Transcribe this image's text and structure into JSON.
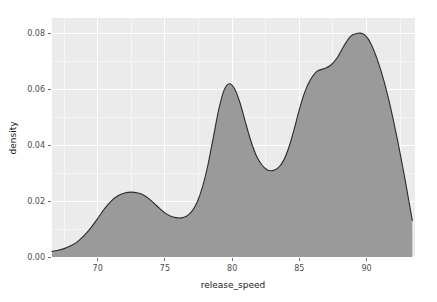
{
  "chart_data": {
    "type": "area",
    "title": "",
    "subtitle": "",
    "xlabel": "release_speed",
    "ylabel": "density",
    "xlim": [
      66.6,
      93.6
    ],
    "ylim": [
      0.0,
      0.0855
    ],
    "xticks": [
      70,
      75,
      80,
      85,
      90
    ],
    "xtick_labels": [
      "70",
      "75",
      "80",
      "85",
      "90"
    ],
    "yticks": [
      0.0,
      0.02,
      0.04,
      0.06,
      0.08
    ],
    "ytick_labels": [
      "0.00",
      "0.02",
      "0.04",
      "0.06",
      "0.08"
    ],
    "grid": true,
    "grid_minor": true,
    "legend": "none",
    "fill_color": "#9a9a9a",
    "line_color": "#2b2b2b",
    "panel_color": "#ebebeb",
    "grid_color": "#ffffff",
    "series": [
      {
        "name": "density",
        "x": [
          66.6,
          67.0,
          67.5,
          68.0,
          68.5,
          69.0,
          69.5,
          70.0,
          70.5,
          71.0,
          71.5,
          72.0,
          72.5,
          73.0,
          73.4,
          73.8,
          74.2,
          74.6,
          75.0,
          75.4,
          75.8,
          76.2,
          76.6,
          77.0,
          77.4,
          77.8,
          78.2,
          78.6,
          79.0,
          79.4,
          79.8,
          80.2,
          80.6,
          81.0,
          81.4,
          81.8,
          82.2,
          82.6,
          83.0,
          83.4,
          83.8,
          84.2,
          84.6,
          85.0,
          85.4,
          85.8,
          86.3,
          86.8,
          87.3,
          87.8,
          88.3,
          88.8,
          89.2,
          89.55,
          89.9,
          90.3,
          90.8,
          91.3,
          91.8,
          92.3,
          92.8,
          93.2,
          93.4
        ],
        "y": [
          0.002,
          0.0023,
          0.003,
          0.004,
          0.0055,
          0.0077,
          0.0105,
          0.0138,
          0.0172,
          0.02,
          0.0219,
          0.0229,
          0.0232,
          0.0229,
          0.0222,
          0.0209,
          0.0192,
          0.0174,
          0.0158,
          0.0147,
          0.0141,
          0.014,
          0.0146,
          0.0163,
          0.0197,
          0.0252,
          0.033,
          0.0428,
          0.0527,
          0.0597,
          0.062,
          0.06,
          0.0549,
          0.048,
          0.0414,
          0.0362,
          0.033,
          0.0312,
          0.0309,
          0.0318,
          0.0343,
          0.039,
          0.0455,
          0.0528,
          0.059,
          0.0632,
          0.0664,
          0.0673,
          0.0685,
          0.0712,
          0.0754,
          0.0789,
          0.0799,
          0.0801,
          0.0793,
          0.0765,
          0.0706,
          0.0628,
          0.0531,
          0.0418,
          0.0293,
          0.0185,
          0.0131
        ]
      }
    ],
    "features": {
      "peak_1": {
        "x": 72.5,
        "y": 0.0232
      },
      "valley_1": {
        "x": 76.2,
        "y": 0.014
      },
      "peak_2": {
        "x": 79.8,
        "y": 0.062
      },
      "valley_2": {
        "x": 83.0,
        "y": 0.0309
      },
      "shoulder": {
        "x": 86.8,
        "y": 0.0673
      },
      "peak_3": {
        "x": 89.55,
        "y": 0.0801
      },
      "right_end": {
        "x": 93.4,
        "y": 0.0131
      }
    }
  }
}
